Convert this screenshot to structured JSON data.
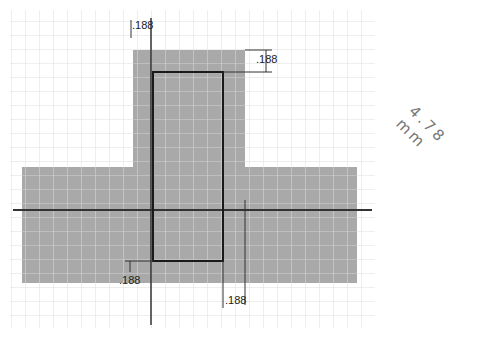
{
  "diagram": {
    "title": "",
    "grid": {
      "spacing_px": 14,
      "color": "#dcdcdc",
      "fill_grid_color": "#d8d8d8"
    },
    "colors": {
      "fill": "#a9a9a9",
      "outline": "#1a1a1a",
      "axis": "#333333"
    },
    "dimensions": {
      "top_left": ".188",
      "top_right": ".188",
      "bottom_left": ".188",
      "bottom_right": ".188"
    },
    "annotation": "4.78 mm"
  }
}
